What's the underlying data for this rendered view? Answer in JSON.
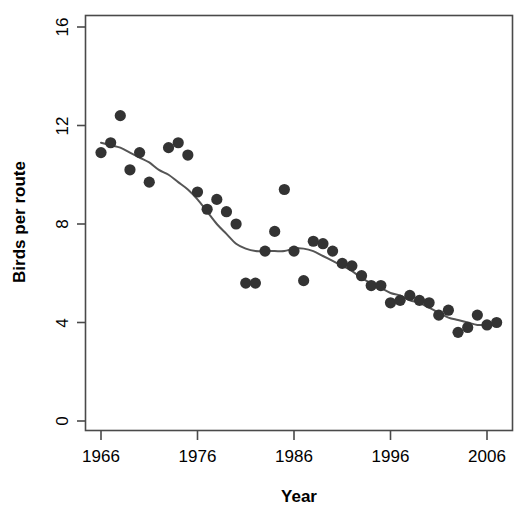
{
  "chart_data": {
    "type": "scatter",
    "title": "",
    "xlabel": "Year",
    "ylabel": "Birds per route",
    "xlim": [
      1965,
      2008
    ],
    "ylim": [
      0,
      16.8
    ],
    "xticks": [
      1966,
      1976,
      1986,
      1996,
      2006
    ],
    "yticks": [
      0,
      4,
      8,
      12,
      16
    ],
    "grid": false,
    "legend": null,
    "point_color": "#333333",
    "line_color": "#555555",
    "series": [
      {
        "name": "Birds per route",
        "type": "scatter",
        "points": [
          {
            "x": 1966,
            "y": 10.9
          },
          {
            "x": 1967,
            "y": 11.3
          },
          {
            "x": 1968,
            "y": 12.4
          },
          {
            "x": 1969,
            "y": 10.2
          },
          {
            "x": 1970,
            "y": 10.9
          },
          {
            "x": 1971,
            "y": 9.7
          },
          {
            "x": 1973,
            "y": 11.1
          },
          {
            "x": 1974,
            "y": 11.3
          },
          {
            "x": 1975,
            "y": 10.8
          },
          {
            "x": 1976,
            "y": 9.3
          },
          {
            "x": 1977,
            "y": 8.6
          },
          {
            "x": 1978,
            "y": 9.0
          },
          {
            "x": 1979,
            "y": 8.5
          },
          {
            "x": 1980,
            "y": 8.0
          },
          {
            "x": 1981,
            "y": 5.6
          },
          {
            "x": 1982,
            "y": 5.6
          },
          {
            "x": 1983,
            "y": 6.9
          },
          {
            "x": 1984,
            "y": 7.7
          },
          {
            "x": 1985,
            "y": 9.4
          },
          {
            "x": 1986,
            "y": 6.9
          },
          {
            "x": 1987,
            "y": 5.7
          },
          {
            "x": 1988,
            "y": 7.3
          },
          {
            "x": 1989,
            "y": 7.2
          },
          {
            "x": 1990,
            "y": 6.9
          },
          {
            "x": 1991,
            "y": 6.4
          },
          {
            "x": 1992,
            "y": 6.3
          },
          {
            "x": 1993,
            "y": 5.9
          },
          {
            "x": 1994,
            "y": 5.5
          },
          {
            "x": 1995,
            "y": 5.5
          },
          {
            "x": 1996,
            "y": 4.8
          },
          {
            "x": 1997,
            "y": 4.9
          },
          {
            "x": 1998,
            "y": 5.1
          },
          {
            "x": 1999,
            "y": 4.9
          },
          {
            "x": 2000,
            "y": 4.8
          },
          {
            "x": 2001,
            "y": 4.3
          },
          {
            "x": 2002,
            "y": 4.5
          },
          {
            "x": 2003,
            "y": 3.6
          },
          {
            "x": 2004,
            "y": 3.8
          },
          {
            "x": 2005,
            "y": 4.3
          },
          {
            "x": 2006,
            "y": 3.9
          },
          {
            "x": 2007,
            "y": 4.0
          }
        ]
      },
      {
        "name": "smooth-trend",
        "type": "line",
        "points": [
          {
            "x": 1966,
            "y": 11.3
          },
          {
            "x": 1967,
            "y": 11.2
          },
          {
            "x": 1968,
            "y": 11.1
          },
          {
            "x": 1969,
            "y": 10.9
          },
          {
            "x": 1970,
            "y": 10.7
          },
          {
            "x": 1971,
            "y": 10.5
          },
          {
            "x": 1972,
            "y": 10.2
          },
          {
            "x": 1973,
            "y": 10.0
          },
          {
            "x": 1974,
            "y": 9.7
          },
          {
            "x": 1975,
            "y": 9.4
          },
          {
            "x": 1976,
            "y": 9.0
          },
          {
            "x": 1977,
            "y": 8.5
          },
          {
            "x": 1978,
            "y": 8.0
          },
          {
            "x": 1979,
            "y": 7.6
          },
          {
            "x": 1980,
            "y": 7.2
          },
          {
            "x": 1981,
            "y": 7.0
          },
          {
            "x": 1982,
            "y": 6.9
          },
          {
            "x": 1983,
            "y": 6.9
          },
          {
            "x": 1984,
            "y": 6.9
          },
          {
            "x": 1985,
            "y": 6.9
          },
          {
            "x": 1986,
            "y": 7.0
          },
          {
            "x": 1987,
            "y": 7.0
          },
          {
            "x": 1988,
            "y": 6.9
          },
          {
            "x": 1989,
            "y": 6.7
          },
          {
            "x": 1990,
            "y": 6.5
          },
          {
            "x": 1991,
            "y": 6.3
          },
          {
            "x": 1992,
            "y": 6.1
          },
          {
            "x": 1993,
            "y": 5.8
          },
          {
            "x": 1994,
            "y": 5.6
          },
          {
            "x": 1995,
            "y": 5.4
          },
          {
            "x": 1996,
            "y": 5.2
          },
          {
            "x": 1997,
            "y": 5.1
          },
          {
            "x": 1998,
            "y": 4.9
          },
          {
            "x": 1999,
            "y": 4.8
          },
          {
            "x": 2000,
            "y": 4.6
          },
          {
            "x": 2001,
            "y": 4.4
          },
          {
            "x": 2002,
            "y": 4.2
          },
          {
            "x": 2003,
            "y": 4.1
          },
          {
            "x": 2004,
            "y": 4.0
          },
          {
            "x": 2005,
            "y": 3.9
          },
          {
            "x": 2006,
            "y": 3.9
          },
          {
            "x": 2007,
            "y": 3.9
          }
        ]
      }
    ]
  },
  "axes": {
    "x_title": "Year",
    "y_title": "Birds per route",
    "x_tick_labels": [
      "1966",
      "1976",
      "1986",
      "1996",
      "2006"
    ],
    "y_tick_labels": [
      "0",
      "4",
      "8",
      "12",
      "16"
    ]
  }
}
